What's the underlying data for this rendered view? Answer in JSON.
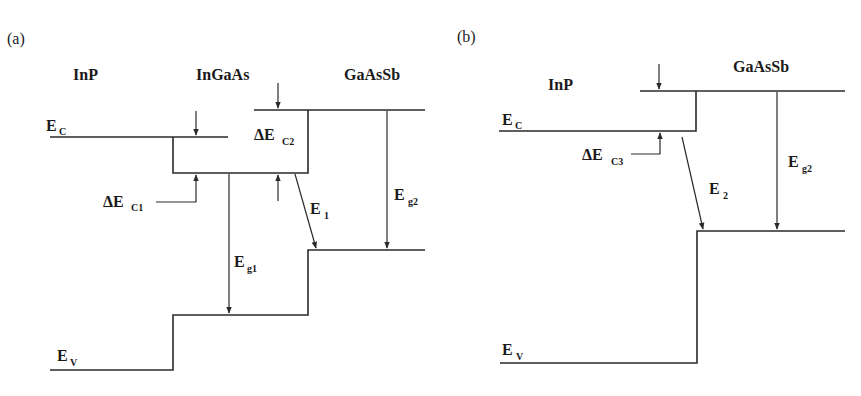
{
  "figure": {
    "panel_a": {
      "label": "(a)",
      "materials": [
        "InP",
        "InGaAs",
        "GaAsSb"
      ],
      "conduction_band_label": {
        "main": "E",
        "sub": "C"
      },
      "valence_band_label": {
        "main": "E",
        "sub": "V"
      },
      "offsets": [
        {
          "main": "ΔE",
          "sub": "C1"
        },
        {
          "main": "ΔE",
          "sub": "C2"
        }
      ],
      "transitions": [
        {
          "main": "E",
          "sub": "g1"
        },
        {
          "main": "E",
          "sub": "1"
        },
        {
          "main": "E",
          "sub": "g2"
        }
      ]
    },
    "panel_b": {
      "label": "(b)",
      "materials": [
        "InP",
        "GaAsSb"
      ],
      "conduction_band_label": {
        "main": "E",
        "sub": "C"
      },
      "valence_band_label": {
        "main": "E",
        "sub": "V"
      },
      "offsets": [
        {
          "main": "ΔE",
          "sub": "C3"
        }
      ],
      "transitions": [
        {
          "main": "E",
          "sub": "2"
        },
        {
          "main": "E",
          "sub": "g2"
        }
      ]
    }
  },
  "colors": {
    "line": "#2a2a2a",
    "text": "#1a1a1a",
    "background": "#ffffff"
  }
}
